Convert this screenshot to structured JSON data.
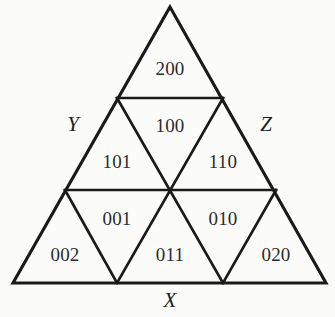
{
  "figure": {
    "background_color": "#fbfbfa",
    "line_color": "#1a1a1a",
    "text_color": "#2b2b2b",
    "geometry": {
      "apex": {
        "x": 170,
        "y": 7
      },
      "bottom_left": {
        "x": 13,
        "y": 283
      },
      "bottom_right": {
        "x": 326,
        "y": 283
      },
      "row_divider_1_y": 98,
      "row_divider_2_y": 190,
      "rows": 3,
      "sub_triangle_count": 9
    }
  },
  "vertices": {
    "top": {
      "label": "",
      "name": "apex-vertex"
    },
    "left": {
      "label": "Y",
      "name": "vertex-label-y",
      "x": 73,
      "y": 126
    },
    "right": {
      "label": "Z",
      "name": "vertex-label-z",
      "x": 266,
      "y": 126
    },
    "bottom": {
      "label": "X",
      "name": "vertex-label-x",
      "x": 170,
      "y": 302
    }
  },
  "cells": [
    {
      "label": "200",
      "orientation": "up",
      "row": 1,
      "x": 170,
      "y": 71
    },
    {
      "label": "100",
      "orientation": "down",
      "row": 2,
      "x": 170,
      "y": 128
    },
    {
      "label": "101",
      "orientation": "up",
      "row": 2,
      "x": 117,
      "y": 164
    },
    {
      "label": "110",
      "orientation": "up",
      "row": 2,
      "x": 223,
      "y": 164
    },
    {
      "label": "001",
      "orientation": "down",
      "row": 3,
      "x": 117,
      "y": 221
    },
    {
      "label": "010",
      "orientation": "down",
      "row": 3,
      "x": 223,
      "y": 221
    },
    {
      "label": "002",
      "orientation": "up",
      "row": 3,
      "x": 65,
      "y": 257
    },
    {
      "label": "011",
      "orientation": "up",
      "row": 3,
      "x": 170,
      "y": 257
    },
    {
      "label": "020",
      "orientation": "up",
      "row": 3,
      "x": 276,
      "y": 257
    }
  ]
}
